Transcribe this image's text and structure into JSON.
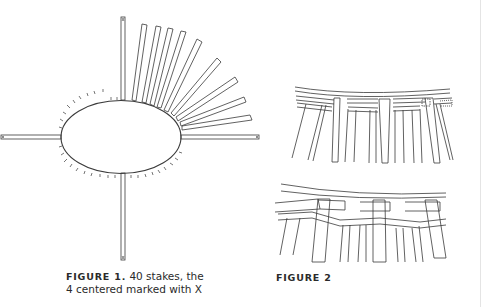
{
  "figure1": {
    "label": "FIGURE 1.",
    "caption_line1": " 40 stakes, the",
    "caption_line2": "4 centered marked with X",
    "stake_count": 40,
    "marker": "X"
  },
  "figure2": {
    "label": "FIGURE 2"
  },
  "colors": {
    "ink": "#333333",
    "background": "#ffffff"
  }
}
